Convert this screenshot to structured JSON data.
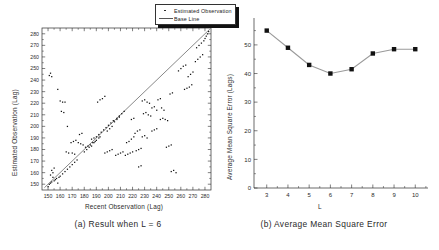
{
  "figure": {
    "panel_a": {
      "caption": "(a) Result when L = 6",
      "xlabel": "Recent Observation (Lag)",
      "ylabel": "Estimated Observation (Lag)",
      "legend": [
        {
          "label": "Estimated Observation",
          "marker": "dot",
          "color": "#111111"
        },
        {
          "label": "Base Line",
          "marker": "line",
          "color": "#555555"
        }
      ]
    },
    "panel_b": {
      "caption": "(b) Average Mean Square Error",
      "xlabel": "L",
      "ylabel": "Average Mean Square Error (Lags)"
    }
  },
  "chart_data": [
    {
      "type": "scatter",
      "title": "(a) Result when L = 6",
      "xlabel": "Recent Observation (Lag)",
      "ylabel": "Estimated Observation (Lag)",
      "xlim": [
        145,
        285
      ],
      "ylim": [
        145,
        285
      ],
      "xticks": [
        150,
        160,
        170,
        180,
        190,
        200,
        210,
        220,
        230,
        240,
        250,
        260,
        270,
        280
      ],
      "yticks": [
        150,
        160,
        170,
        180,
        190,
        200,
        210,
        220,
        230,
        240,
        250,
        260,
        270,
        280
      ],
      "grid": false,
      "legend_position": "top-right",
      "series": [
        {
          "name": "Base Line",
          "type": "line",
          "color": "#555555",
          "points": [
            [
              147,
              147
            ],
            [
              284,
              284
            ]
          ]
        },
        {
          "name": "Estimated Observation",
          "type": "scatter",
          "color": "#111111",
          "points": [
            [
              150,
              148
            ],
            [
              151,
              150
            ],
            [
              152,
              151
            ],
            [
              153,
              152
            ],
            [
              152,
              158
            ],
            [
              154,
              160
            ],
            [
              153,
              162
            ],
            [
              155,
              164
            ],
            [
              151,
              244
            ],
            [
              152,
              246
            ],
            [
              153,
              243
            ],
            [
              158,
              232
            ],
            [
              160,
              222
            ],
            [
              162,
              221
            ],
            [
              164,
              221
            ],
            [
              161,
              213
            ],
            [
              163,
              212
            ],
            [
              166,
              200
            ],
            [
              165,
              178
            ],
            [
              167,
              177
            ],
            [
              170,
              177
            ],
            [
              172,
              176
            ],
            [
              169,
              186
            ],
            [
              171,
              187
            ],
            [
              173,
              188
            ],
            [
              175,
              186
            ],
            [
              177,
              185
            ],
            [
              179,
              184
            ],
            [
              176,
              193
            ],
            [
              178,
              194
            ],
            [
              181,
              182
            ],
            [
              183,
              183
            ],
            [
              185,
              184
            ],
            [
              187,
              186
            ],
            [
              186,
              189
            ],
            [
              188,
              190
            ],
            [
              190,
              191
            ],
            [
              192,
              193
            ],
            [
              194,
              195
            ],
            [
              196,
              197
            ],
            [
              198,
              199
            ],
            [
              200,
              201
            ],
            [
              202,
              203
            ],
            [
              204,
              205
            ],
            [
              191,
              221
            ],
            [
              193,
              223
            ],
            [
              195,
              224
            ],
            [
              197,
              226
            ],
            [
              199,
              196
            ],
            [
              201,
              198
            ],
            [
              203,
              200
            ],
            [
              197,
              177
            ],
            [
              199,
              178
            ],
            [
              201,
              179
            ],
            [
              203,
              180
            ],
            [
              206,
              175
            ],
            [
              208,
              176
            ],
            [
              210,
              177
            ],
            [
              212,
              178
            ],
            [
              207,
              207
            ],
            [
              209,
              209
            ],
            [
              211,
              211
            ],
            [
              213,
              213
            ],
            [
              214,
              175
            ],
            [
              216,
              176
            ],
            [
              218,
              177
            ],
            [
              220,
              178
            ],
            [
              215,
              186
            ],
            [
              217,
              187
            ],
            [
              219,
              189
            ],
            [
              221,
              191
            ],
            [
              222,
              194
            ],
            [
              224,
              196
            ],
            [
              226,
              197
            ],
            [
              223,
              179
            ],
            [
              225,
              180
            ],
            [
              227,
              181
            ],
            [
              228,
              222
            ],
            [
              230,
              223
            ],
            [
              232,
              221
            ],
            [
              234,
              220
            ],
            [
              229,
              211
            ],
            [
              231,
              212
            ],
            [
              233,
              210
            ],
            [
              235,
              209
            ],
            [
              228,
              191
            ],
            [
              230,
              192
            ],
            [
              232,
              190
            ],
            [
              236,
              216
            ],
            [
              238,
              217
            ],
            [
              240,
              214
            ],
            [
              243,
              206
            ],
            [
              245,
              207
            ],
            [
              247,
              206
            ],
            [
              249,
              205
            ],
            [
              244,
              216
            ],
            [
              246,
              214
            ],
            [
              252,
              161
            ],
            [
              254,
              162
            ],
            [
              256,
              160
            ],
            [
              258,
              248
            ],
            [
              260,
              250
            ],
            [
              262,
              252
            ],
            [
              264,
              253
            ],
            [
              251,
              228
            ],
            [
              253,
              229
            ],
            [
              263,
              232
            ],
            [
              265,
              233
            ],
            [
              267,
              234
            ],
            [
              269,
              236
            ],
            [
              266,
              243
            ],
            [
              268,
              245
            ],
            [
              270,
              247
            ],
            [
              272,
              256
            ],
            [
              274,
              258
            ],
            [
              276,
              260
            ],
            [
              278,
              262
            ],
            [
              273,
              268
            ],
            [
              275,
              270
            ],
            [
              277,
              272
            ],
            [
              279,
              274
            ],
            [
              280,
              276
            ],
            [
              281,
              278
            ],
            [
              282,
              280
            ],
            [
              283,
              282
            ],
            [
              160,
              157
            ],
            [
              162,
              159
            ],
            [
              164,
              161
            ],
            [
              166,
              163
            ],
            [
              168,
              165
            ],
            [
              170,
              167
            ],
            [
              172,
              169
            ],
            [
              174,
              171
            ],
            [
              180,
              178
            ],
            [
              182,
              180
            ],
            [
              184,
              182
            ],
            [
              188,
              186
            ],
            [
              190,
              188
            ],
            [
              192,
              190
            ],
            [
              155,
              153
            ],
            [
              157,
              155
            ],
            [
              159,
              156
            ],
            [
              186,
              183
            ],
            [
              189,
              187
            ],
            [
              193,
              191
            ],
            [
              205,
              204
            ],
            [
              207,
              206
            ],
            [
              209,
              208
            ],
            [
              158,
              151
            ],
            [
              156,
              154
            ],
            [
              154,
              156
            ],
            [
              219,
              206
            ],
            [
              221,
              207
            ],
            [
              241,
              223
            ],
            [
              243,
              224
            ],
            [
              236,
              196
            ],
            [
              238,
              197
            ],
            [
              240,
              198
            ],
            [
              225,
              165
            ],
            [
              227,
              166
            ],
            [
              248,
              182
            ],
            [
              250,
              183
            ],
            [
              252,
              184
            ]
          ]
        }
      ]
    },
    {
      "type": "line",
      "title": "(b) Average Mean Square Error",
      "xlabel": "L",
      "ylabel": "Average Mean Square Error (Lags)",
      "x": [
        3,
        4,
        5,
        6,
        7,
        8,
        9,
        10
      ],
      "values": [
        55,
        49,
        43,
        40,
        41.5,
        47,
        48.5,
        48.5
      ],
      "xlim": [
        2.4,
        10.6
      ],
      "ylim": [
        0,
        58
      ],
      "xticks": [
        3,
        4,
        5,
        6,
        7,
        8,
        9,
        10
      ],
      "yticks": [
        0,
        10,
        20,
        30,
        40,
        50
      ],
      "grid": false,
      "marker": "square",
      "marker_color": "#111111",
      "line_color": "#9a9a9a",
      "legend_position": "none"
    }
  ]
}
